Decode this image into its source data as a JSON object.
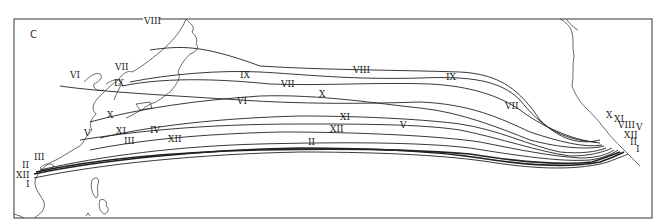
{
  "figure": {
    "panel_label": "C"
  },
  "months": {
    "I": "I",
    "II": "II",
    "III": "III",
    "IV": "IV",
    "V": "V",
    "VI": "VI",
    "VII": "VII",
    "VIII": "VIII",
    "IX": "IX",
    "X": "X",
    "XI": "XI",
    "XII": "XII"
  },
  "labels": {
    "west": [
      "VIII",
      "VII",
      "VI",
      "IX",
      "X",
      "V",
      "XI",
      "IV",
      "III",
      "XII",
      "II",
      "III",
      "XII",
      "I"
    ],
    "mid": [
      "IX",
      "VIII",
      "VII",
      "VI",
      "X",
      "XI",
      "V",
      "XII",
      "II",
      "IX",
      "VII"
    ],
    "east": [
      "X",
      "XI",
      "VIII",
      "V",
      "XII",
      "II",
      "I"
    ]
  }
}
